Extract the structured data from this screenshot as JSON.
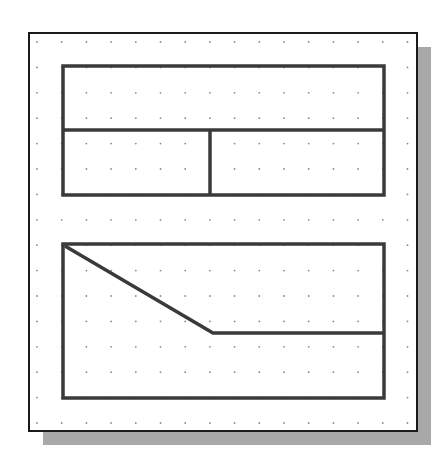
{
  "colors": {
    "background": "#ffffff",
    "frame_border": "#1a1a1a",
    "shadow": "#a8a8a8",
    "grid_dot": "#8a8a8a",
    "shape_stroke": "#3a3a3a"
  },
  "frame": {
    "x": 29,
    "y": 33,
    "width": 388,
    "height": 398,
    "shadow_offset": 14
  },
  "grid": {
    "start_x": 37,
    "start_y": 42,
    "spacing_x": 24.7,
    "spacing_y": 25.4,
    "cols": 16,
    "rows": 16
  },
  "shapes": {
    "top_rect": {
      "x": 63,
      "y": 66,
      "width": 321,
      "height": 129
    },
    "top_hdivider": {
      "x1": 63,
      "y1": 130,
      "x2": 384,
      "y2": 130
    },
    "top_vdivider": {
      "x1": 210,
      "y1": 130,
      "x2": 210,
      "y2": 195
    },
    "bottom_rect": {
      "x": 63,
      "y": 244,
      "width": 321,
      "height": 154
    },
    "bottom_polyline": "65,246 213,333 384,333"
  }
}
